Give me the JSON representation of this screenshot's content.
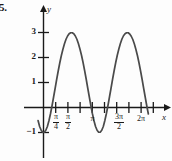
{
  "problem_number": "5.",
  "axes": {
    "y_label": "y",
    "x_label": "x",
    "y_ticks": [
      "3",
      "2",
      "1",
      "−1"
    ],
    "x_tick_labels": [
      "π/4",
      "π/2",
      "π",
      "3π/2",
      "2π"
    ],
    "x_tick_parts": [
      {
        "num": "π",
        "den": "4"
      },
      {
        "num": "π",
        "den": "2"
      },
      {
        "plain": "π"
      },
      {
        "num": "3π",
        "den": "2"
      },
      {
        "plain": "2π"
      }
    ]
  },
  "curve_color": "#4a4a4a",
  "axis_color": "#1a1a1a",
  "chart_data": {
    "type": "line",
    "title": "",
    "xlabel": "x",
    "ylabel": "y",
    "xlim": [
      -0.35,
      7.3
    ],
    "ylim": [
      -1.6,
      3.8
    ],
    "grid": false,
    "legend": null,
    "function": "y = 1 - 2cos(2x)",
    "amplitude": 2,
    "midline": 1,
    "period": 3.14159,
    "maxima": [
      {
        "x": 1.5708,
        "y": 3
      },
      {
        "x": 4.7124,
        "y": 3
      }
    ],
    "minima": [
      {
        "x": 0,
        "y": -1
      },
      {
        "x": 3.14159,
        "y": -1
      },
      {
        "x": 6.2832,
        "y": -1
      }
    ],
    "x_tick_values": [
      0.7854,
      1.5708,
      3.14159,
      4.7124,
      6.2832
    ],
    "y_tick_values": [
      3,
      2,
      1,
      -1
    ],
    "x": [
      -0.35,
      -0.25,
      -0.15,
      -0.05,
      0.05,
      0.15,
      0.25,
      0.35,
      0.45,
      0.55,
      0.65,
      0.75,
      0.85,
      0.95,
      1.05,
      1.15,
      1.25,
      1.35,
      1.45,
      1.55,
      1.65,
      1.75,
      1.85,
      1.95,
      2.05,
      2.15,
      2.25,
      2.35,
      2.45,
      2.55,
      2.65,
      2.75,
      2.85,
      2.95,
      3.05,
      3.15,
      3.25,
      3.35,
      3.45,
      3.55,
      3.65,
      3.75,
      3.85,
      3.95,
      4.05,
      4.15,
      4.25,
      4.35,
      4.45,
      4.55,
      4.65,
      4.75,
      4.85,
      4.95,
      5.05,
      5.15,
      5.25,
      5.35,
      5.45,
      5.55,
      5.65,
      5.75,
      5.85,
      5.95,
      6.05,
      6.15,
      6.25,
      6.35,
      6.45,
      6.55,
      6.65,
      6.75
    ],
    "y": [
      -0.52,
      -0.76,
      -0.91,
      -0.99,
      -0.99,
      -0.91,
      -0.76,
      -0.53,
      -0.25,
      0.07,
      0.42,
      0.77,
      1.13,
      1.47,
      1.79,
      2.08,
      2.33,
      2.55,
      2.73,
      2.86,
      2.95,
      2.99,
      2.99,
      2.95,
      2.86,
      2.73,
      2.55,
      2.33,
      2.08,
      1.79,
      1.47,
      1.13,
      0.77,
      0.42,
      0.07,
      -0.25,
      -0.53,
      -0.76,
      -0.91,
      -0.99,
      -0.99,
      -0.91,
      -0.76,
      -0.52,
      -0.24,
      0.08,
      0.43,
      0.78,
      1.14,
      1.48,
      1.8,
      2.09,
      2.34,
      2.56,
      2.74,
      2.87,
      2.95,
      2.99,
      2.99,
      2.94,
      2.85,
      2.72,
      2.54,
      2.32,
      2.07,
      1.78,
      1.46,
      1.12,
      0.76,
      0.41,
      0.06,
      -0.26
    ]
  }
}
